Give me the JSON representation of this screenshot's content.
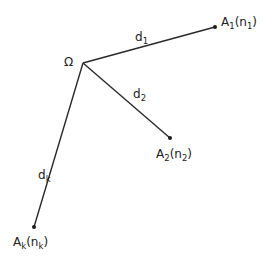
{
  "diagram": {
    "center": {
      "label": "Ω",
      "x": 83,
      "y": 63
    },
    "nodes": [
      {
        "id": "A1",
        "base": "A",
        "sub": "1",
        "paren_base": "n",
        "paren_sub": "1",
        "x": 215,
        "y": 27
      },
      {
        "id": "A2",
        "base": "A",
        "sub": "2",
        "paren_base": "n",
        "paren_sub": "2",
        "x": 170,
        "y": 138
      },
      {
        "id": "Ak",
        "base": "A",
        "sub": "k",
        "paren_base": "n",
        "paren_sub": "k",
        "x": 34,
        "y": 227
      }
    ],
    "edges": [
      {
        "from": "Ω",
        "to": "A1",
        "base": "d",
        "sub": "1"
      },
      {
        "from": "Ω",
        "to": "A2",
        "base": "d",
        "sub": "2"
      },
      {
        "from": "Ω",
        "to": "Ak",
        "base": "d",
        "sub": "k"
      }
    ],
    "colors": {
      "line": "#2a2a2a",
      "text": "#222222",
      "background": "#ffffff"
    }
  }
}
